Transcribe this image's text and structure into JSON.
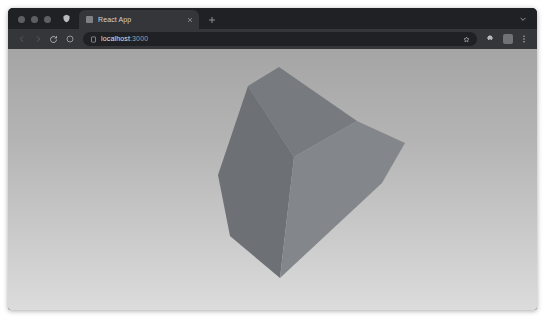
{
  "window": {
    "traffic_lights": [
      "close",
      "minimize",
      "zoom"
    ]
  },
  "tabstrip": {
    "left_icon": "shield-icon",
    "tab": {
      "title": "React App",
      "favicon": "react-favicon",
      "close_label": "×"
    },
    "new_tab_label": "+",
    "tab_search_label": "⌄"
  },
  "toolbar": {
    "back_label": "‹",
    "forward_label": "›",
    "reload_label": "⟳",
    "shield_label": "shield",
    "page_icon_label": "page",
    "url_text": "localhost",
    "url_port": ":3000",
    "url_full": "localhost:3000",
    "url_placeholder": "Search Google or type a URL",
    "star_label": "☆",
    "bookmark_label": "☆",
    "extensions_label": "extensions",
    "profile_label": "profile",
    "menu_label": "⋮"
  },
  "viewport": {
    "title": "3d-cube-scene",
    "background": {
      "type": "vertical-gradient",
      "top_color": "#a5a5a5",
      "bottom_color": "#dcdcdc"
    },
    "object": {
      "name": "rotated-cube",
      "faces": [
        {
          "name": "top-face",
          "color": "#777a7e"
        },
        {
          "name": "front-face",
          "color": "#6d7074"
        },
        {
          "name": "right-face",
          "color": "#83868b"
        }
      ],
      "vertices": {
        "top": [
          271,
          18
        ],
        "upper_left": [
          240,
          37
        ],
        "left": [
          210,
          126
        ],
        "lower_left": [
          222,
          187
        ],
        "bottom": [
          272,
          229
        ],
        "lower_right": [
          374,
          134
        ],
        "right": [
          397,
          94
        ],
        "mid_right": [
          349,
          72
        ],
        "mid_center": [
          286,
          108
        ]
      }
    }
  }
}
